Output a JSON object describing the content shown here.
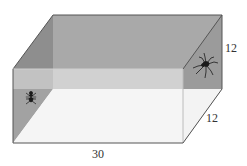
{
  "diagram": {
    "dimensions": {
      "length": "30",
      "height": "12",
      "width": "12"
    },
    "labels": {
      "bottom_edge": "30",
      "right_vertical_edge": "12",
      "right_depth_edge": "12"
    },
    "objects": [
      {
        "name": "fly",
        "location": "left end wall"
      },
      {
        "name": "spider",
        "location": "right end wall"
      }
    ],
    "colors": {
      "back_wall": "#a9a9a9",
      "left_wall": "#8e8e8e",
      "right_wall": "#9b9b9b",
      "floor": "#f3f3f3",
      "front_glass_top": "#d6d6d6",
      "edge": "#555555",
      "insect": "#1a1a1a"
    }
  }
}
